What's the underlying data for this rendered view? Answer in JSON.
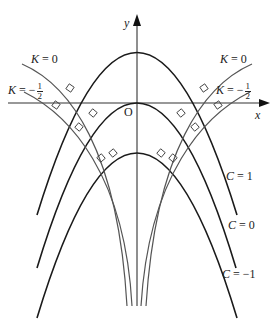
{
  "diagram": {
    "axes": {
      "x_label": "x",
      "y_label": "y",
      "origin_label": "O"
    },
    "family_C": {
      "description": "Parabolas y = C - k x^2 (opening downward)",
      "curves": [
        {
          "label_var": "C",
          "label_eq": "=",
          "label_val": "1"
        },
        {
          "label_var": "C",
          "label_eq": "=",
          "label_val": "0"
        },
        {
          "label_var": "C",
          "label_eq": "=",
          "label_val": "−1"
        }
      ]
    },
    "family_K": {
      "description": "Orthogonal trajectories, symmetric on both sides",
      "curves": [
        {
          "label_var": "K",
          "label_eq": "=",
          "label_val": "0"
        },
        {
          "label_var": "K",
          "label_eq": "=",
          "label_sign": "−",
          "label_num": "1",
          "label_den": "2"
        }
      ]
    },
    "colors": {
      "parabola": "#1a1a1a",
      "trajectory": "#555555",
      "axis": "#333333"
    }
  }
}
